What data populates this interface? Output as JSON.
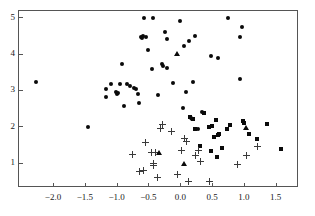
{
  "chart_data": {
    "type": "scatter",
    "title": "",
    "xlabel": "",
    "ylabel": "",
    "xlim": [
      -2.55,
      1.85
    ],
    "ylim": [
      0.33,
      5.2
    ],
    "grid": false,
    "legend": "none",
    "xticks": [
      -2.0,
      -1.5,
      -1.0,
      -0.5,
      0.0,
      0.5,
      1.0,
      1.5
    ],
    "xtick_labels": [
      "-2.0",
      "-1.5",
      "-1.0",
      "-0.5",
      "0.0",
      "0.5",
      "1.0",
      "1.5"
    ],
    "yticks": [
      1,
      2,
      3,
      4,
      5
    ],
    "ytick_labels": [
      "1",
      "2",
      "3",
      "4",
      "5"
    ],
    "marker_color": "#0a0a0a",
    "plus_color": "#3a3a3a",
    "axis_color": "#555555",
    "series": [
      {
        "name": "group-1",
        "marker": "circle",
        "points": [
          [
            -2.28,
            3.25
          ],
          [
            -1.46,
            2.01
          ],
          [
            -1.19,
            3.06
          ],
          [
            -1.19,
            2.84
          ],
          [
            -1.1,
            3.2
          ],
          [
            -1.03,
            2.98
          ],
          [
            -1.01,
            2.93
          ],
          [
            -1.0,
            2.95
          ],
          [
            -0.96,
            3.18
          ],
          [
            -0.93,
            3.73
          ],
          [
            -0.9,
            2.58
          ],
          [
            -0.86,
            3.18
          ],
          [
            -0.8,
            3.15
          ],
          [
            -0.75,
            3.08
          ],
          [
            -0.71,
            3.05
          ],
          [
            -0.68,
            2.93
          ],
          [
            -0.66,
            2.66
          ],
          [
            -0.64,
            4.48
          ],
          [
            -0.62,
            4.46
          ],
          [
            -0.6,
            4.52
          ],
          [
            -0.58,
            5.0
          ],
          [
            -0.55,
            4.49
          ],
          [
            -0.52,
            4.13
          ],
          [
            -0.46,
            3.6
          ],
          [
            -0.44,
            5.0
          ],
          [
            -0.36,
            2.9
          ],
          [
            -0.31,
            3.74
          ],
          [
            -0.28,
            3.7
          ],
          [
            -0.26,
            4.63
          ],
          [
            -0.23,
            4.42
          ],
          [
            -0.22,
            3.62
          ],
          [
            -0.13,
            3.21
          ],
          [
            -0.02,
            4.92
          ],
          [
            0.03,
            2.52
          ],
          [
            0.05,
            4.25
          ],
          [
            0.08,
            2.98
          ],
          [
            0.12,
            4.38
          ],
          [
            0.15,
            2.26
          ],
          [
            0.17,
            2.22
          ],
          [
            0.19,
            3.24
          ],
          [
            0.21,
            4.5
          ],
          [
            0.26,
            1.95
          ],
          [
            0.33,
            2.41
          ],
          [
            0.47,
            3.96
          ],
          [
            0.57,
            3.92
          ],
          [
            0.73,
            5.01
          ],
          [
            0.92,
            4.49
          ],
          [
            0.93,
            3.32
          ],
          [
            0.96,
            4.76
          ]
        ]
      },
      {
        "name": "group-2",
        "marker": "square",
        "points": [
          [
            0.14,
            2.28
          ],
          [
            0.18,
            2.24
          ],
          [
            0.21,
            1.94
          ],
          [
            0.36,
            2.4
          ],
          [
            0.46,
            1.35
          ],
          [
            0.49,
            2.04
          ],
          [
            0.51,
            1.73
          ],
          [
            0.54,
            2.19
          ],
          [
            0.56,
            1.17
          ],
          [
            0.58,
            1.79
          ],
          [
            0.6,
            1.82
          ],
          [
            0.64,
            1.43
          ],
          [
            0.72,
            1.95
          ],
          [
            0.77,
            2.05
          ],
          [
            0.97,
            2.17
          ],
          [
            0.99,
            2.11
          ],
          [
            1.06,
            1.82
          ],
          [
            1.19,
            1.67
          ],
          [
            1.35,
            2.08
          ],
          [
            1.57,
            1.4
          ],
          [
            0.3,
            1.48
          ],
          [
            0.44,
            2.02
          ]
        ]
      },
      {
        "name": "group-3",
        "marker": "plus",
        "points": [
          [
            -0.77,
            1.24
          ],
          [
            -0.66,
            0.79
          ],
          [
            -0.6,
            0.8
          ],
          [
            -0.57,
            1.57
          ],
          [
            -0.47,
            1.32
          ],
          [
            -0.44,
            1.0
          ],
          [
            -0.43,
            0.96
          ],
          [
            -0.41,
            1.31
          ],
          [
            -0.37,
            0.62
          ],
          [
            -0.32,
            1.96
          ],
          [
            -0.29,
            2.08
          ],
          [
            -0.15,
            1.88
          ],
          [
            -0.06,
            0.71
          ],
          [
            0.0,
            1.36
          ],
          [
            0.05,
            1.7
          ],
          [
            0.08,
            1.61
          ],
          [
            0.12,
            0.52
          ],
          [
            0.22,
            1.22
          ],
          [
            0.27,
            1.37
          ],
          [
            0.3,
            1.05
          ],
          [
            0.45,
            0.51
          ],
          [
            0.88,
            0.97
          ],
          [
            1.02,
            1.22
          ],
          [
            1.2,
            1.48
          ]
        ]
      },
      {
        "name": "group-4",
        "marker": "triangle",
        "points": [
          [
            -0.07,
            4.02
          ],
          [
            -0.35,
            1.3
          ],
          [
            0.05,
            1.0
          ],
          [
            1.01,
            1.99
          ]
        ]
      }
    ]
  }
}
